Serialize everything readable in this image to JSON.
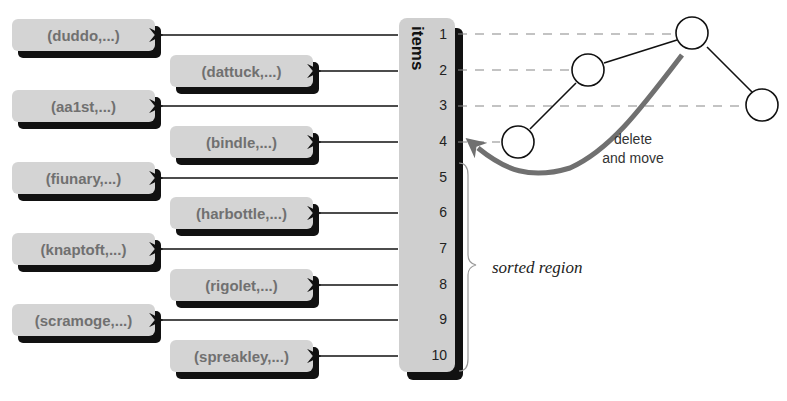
{
  "diagram": {
    "items_label": "items",
    "indices": [
      "1",
      "2",
      "3",
      "4",
      "5",
      "6",
      "7",
      "8",
      "9",
      "10"
    ],
    "records": [
      {
        "index": "1",
        "label": "(duddo,...)"
      },
      {
        "index": "2",
        "label": "(dattuck,...)"
      },
      {
        "index": "3",
        "label": "(aa1st,...)"
      },
      {
        "index": "4",
        "label": "(bindle,...)"
      },
      {
        "index": "5",
        "label": "(fiunary,...)"
      },
      {
        "index": "6",
        "label": "(harbottle,...)"
      },
      {
        "index": "7",
        "label": "(knaptoft,...)"
      },
      {
        "index": "8",
        "label": "(rigolet,...)"
      },
      {
        "index": "9",
        "label": "(scramoge,...)"
      },
      {
        "index": "10",
        "label": "(spreakley,...)"
      }
    ],
    "annotation": {
      "line1": "delete",
      "line2": "and move"
    },
    "sorted_label": "sorted region",
    "colors": {
      "box_fill": "#d4d4d4",
      "box_text": "#707070",
      "shadow": "#111111",
      "arrow": "#707070"
    }
  }
}
